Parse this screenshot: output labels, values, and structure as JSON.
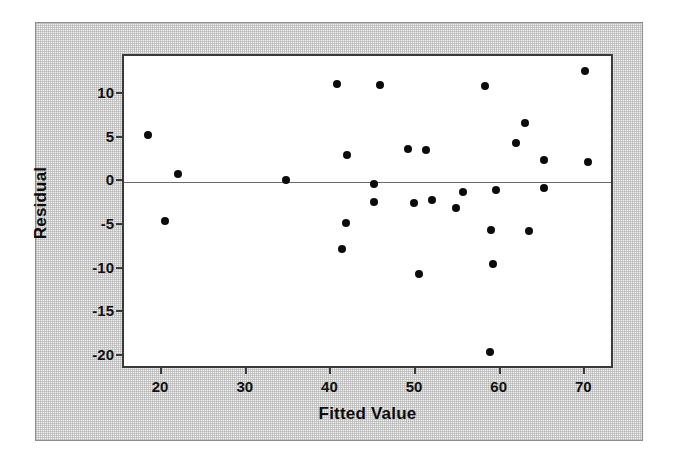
{
  "chart_data": {
    "type": "scatter",
    "title": "",
    "xlabel": "Fitted Value",
    "ylabel": "Residual",
    "xlim": [
      15.5,
      73.5
    ],
    "ylim": [
      -21.5,
      14.5
    ],
    "xticks": [
      20,
      30,
      40,
      50,
      60,
      70
    ],
    "yticks": [
      10,
      5,
      0,
      -5,
      -10,
      -15,
      -20
    ],
    "xtick_labels": [
      "20",
      "30",
      "40",
      "50",
      "60",
      "70"
    ],
    "ytick_labels": [
      "10",
      "5",
      "0",
      "-5",
      "-10",
      "-15",
      "-20"
    ],
    "grid": false,
    "legend": null,
    "reference_line": {
      "axis": "y",
      "value": 0,
      "color": "#6b6b6b"
    },
    "marker": {
      "shape": "circle",
      "color": "#0b0b0b",
      "size": 8
    },
    "points": [
      {
        "x": 18.3,
        "y": 5.5
      },
      {
        "x": 20.4,
        "y": -4.4
      },
      {
        "x": 21.9,
        "y": 1.0
      },
      {
        "x": 34.6,
        "y": 0.3
      },
      {
        "x": 40.7,
        "y": 11.3
      },
      {
        "x": 41.3,
        "y": -7.6
      },
      {
        "x": 41.7,
        "y": -4.7
      },
      {
        "x": 41.9,
        "y": 3.1
      },
      {
        "x": 45.0,
        "y": -0.2
      },
      {
        "x": 45.0,
        "y": -2.2
      },
      {
        "x": 45.7,
        "y": 11.2
      },
      {
        "x": 49.0,
        "y": 3.8
      },
      {
        "x": 49.8,
        "y": -2.4
      },
      {
        "x": 50.4,
        "y": -10.5
      },
      {
        "x": 51.2,
        "y": 3.7
      },
      {
        "x": 51.9,
        "y": -2.0
      },
      {
        "x": 54.7,
        "y": -2.9
      },
      {
        "x": 55.5,
        "y": -1.1
      },
      {
        "x": 58.2,
        "y": 11.1
      },
      {
        "x": 58.7,
        "y": -19.4
      },
      {
        "x": 58.9,
        "y": -5.4
      },
      {
        "x": 59.1,
        "y": -9.4
      },
      {
        "x": 59.5,
        "y": -0.9
      },
      {
        "x": 61.8,
        "y": 4.5
      },
      {
        "x": 62.9,
        "y": 6.8
      },
      {
        "x": 63.3,
        "y": -5.6
      },
      {
        "x": 65.1,
        "y": 2.6
      },
      {
        "x": 65.1,
        "y": -0.6
      },
      {
        "x": 69.9,
        "y": 12.8
      },
      {
        "x": 70.3,
        "y": 2.3
      }
    ]
  },
  "colors": {
    "panel_background": "#f2f2f2",
    "panel_border": "#8e8e8e",
    "plot_background": "#ffffff",
    "plot_border": "#3a3a3a",
    "marker": "#0b0b0b",
    "zero_line": "#6b6b6b",
    "text": "#111111"
  }
}
